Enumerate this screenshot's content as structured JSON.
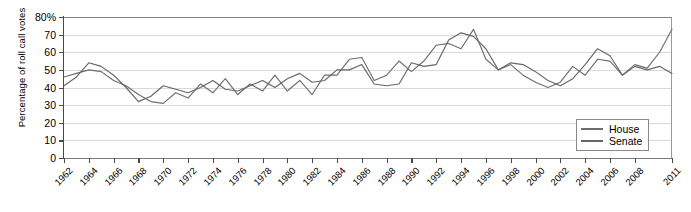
{
  "chart_data": {
    "type": "line",
    "title": "",
    "xlabel": "",
    "ylabel": "Percentage of roll call votes",
    "ylim": [
      0,
      80
    ],
    "ytick_labels": [
      "80%",
      "70",
      "60",
      "50",
      "40",
      "30",
      "20",
      "10",
      "0"
    ],
    "ytick_values": [
      80,
      70,
      60,
      50,
      40,
      30,
      20,
      10,
      0
    ],
    "grid": true,
    "legend_position": "bottom-right",
    "x": [
      1962,
      1963,
      1964,
      1965,
      1966,
      1967,
      1968,
      1969,
      1970,
      1971,
      1972,
      1973,
      1974,
      1975,
      1976,
      1977,
      1978,
      1979,
      1980,
      1981,
      1982,
      1983,
      1984,
      1985,
      1986,
      1987,
      1988,
      1989,
      1990,
      1991,
      1992,
      1993,
      1994,
      1995,
      1996,
      1997,
      1998,
      1999,
      2000,
      2001,
      2002,
      2003,
      2004,
      2005,
      2006,
      2007,
      2008,
      2009,
      2010,
      2011
    ],
    "xtick_labels": [
      "1962",
      "1964",
      "1966",
      "1968",
      "1970",
      "1972",
      "1974",
      "1976",
      "1978",
      "1980",
      "1982",
      "1984",
      "1986",
      "1988",
      "1990",
      "1992",
      "1994",
      "1996",
      "1998",
      "2000",
      "2002",
      "2004",
      "2006",
      "2008",
      "2011"
    ],
    "xtick_values": [
      1962,
      1964,
      1966,
      1968,
      1970,
      1972,
      1974,
      1976,
      1978,
      1980,
      1982,
      1984,
      1986,
      1988,
      1990,
      1992,
      1994,
      1996,
      1998,
      2000,
      2002,
      2004,
      2006,
      2008,
      2011
    ],
    "series": [
      {
        "name": "House",
        "color": "#6e6e6e",
        "values": [
          46,
          48,
          50,
          49,
          44,
          41,
          36,
          32,
          31,
          37,
          34,
          42,
          37,
          45,
          36,
          42,
          38,
          47,
          38,
          44,
          36,
          47,
          47,
          56,
          57,
          44,
          47,
          55,
          49,
          55,
          64,
          65,
          62,
          73,
          56,
          50,
          53,
          47,
          43,
          40,
          43,
          52,
          47,
          56,
          55,
          47,
          53,
          51,
          60,
          73
        ]
      },
      {
        "name": "Senate",
        "color": "#666666",
        "values": [
          41,
          46,
          54,
          52,
          47,
          40,
          32,
          35,
          41,
          39,
          37,
          40,
          44,
          39,
          38,
          41,
          44,
          40,
          45,
          48,
          43,
          44,
          50,
          50,
          53,
          42,
          41,
          42,
          54,
          52,
          53,
          67,
          71,
          69,
          62,
          50,
          54,
          53,
          49,
          44,
          41,
          45,
          53,
          62,
          58,
          47,
          52,
          50,
          52,
          48
        ]
      }
    ],
    "series_notes": {
      "house_peak": 73,
      "senate_peak": 71,
      "units": "percent"
    }
  },
  "legend": {
    "items": [
      {
        "label": "House"
      },
      {
        "label": "Senate"
      }
    ]
  },
  "colors": {
    "house": "#6e6e6e",
    "senate": "#666666",
    "grid": "#d9d9d9",
    "axis": "#4a4a4a"
  }
}
